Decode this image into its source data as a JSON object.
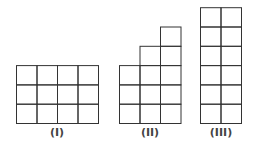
{
  "figures": [
    {
      "label": "(I)",
      "columns": [
        3,
        3,
        3,
        3
      ],
      "x": 16.5,
      "label_x": 57
    },
    {
      "label": "(II)",
      "columns": [
        3,
        4,
        5
      ],
      "x": 119.5,
      "label_x": 150
    },
    {
      "label": "(III)",
      "columns": [
        6,
        6
      ],
      "x": 200.5,
      "label_x": 221
    }
  ],
  "cell": {
    "w": 20.5,
    "h": 19.3
  },
  "baseline_y": 123.5,
  "label_y": 126,
  "line_color": "#333333"
}
